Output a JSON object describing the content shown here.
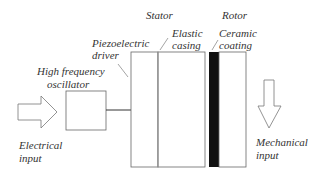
{
  "diagram": {
    "labels": {
      "stator": "Stator",
      "rotor": "Rotor",
      "piezo_line1": "Piezoelectric",
      "piezo_line2": "driver",
      "elastic_line1": "Elastic",
      "elastic_line2": "casing",
      "ceramic_line1": "Ceramic",
      "ceramic_line2": "coating",
      "osc_line1": "High frequency",
      "osc_line2": "oscillator",
      "elec_line1": "Electrical",
      "elec_line2": "input",
      "mech_line1": "Mechanical",
      "mech_line2": "input"
    },
    "colors": {
      "line": "#666666",
      "coating": "#111111"
    }
  }
}
